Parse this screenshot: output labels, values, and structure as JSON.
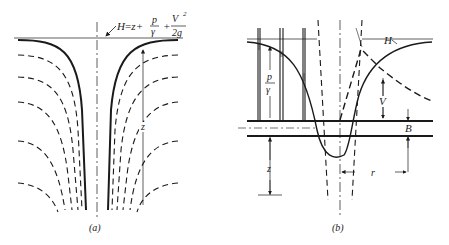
{
  "figure": {
    "panel_a": {
      "caption": "(a)",
      "equation": {
        "lhs": "H",
        "eq": "=",
        "z": "z",
        "plus1": "+",
        "p": "p",
        "gamma": "γ",
        "plus2": "+",
        "V": "V",
        "sq": "2",
        "twog": "2g"
      },
      "z_label": "z"
    },
    "panel_b": {
      "caption": "(b)",
      "labels": {
        "H": "H",
        "p": "p",
        "gamma": "γ",
        "V": "V",
        "B": "B",
        "z": "z",
        "r": "r"
      }
    }
  }
}
